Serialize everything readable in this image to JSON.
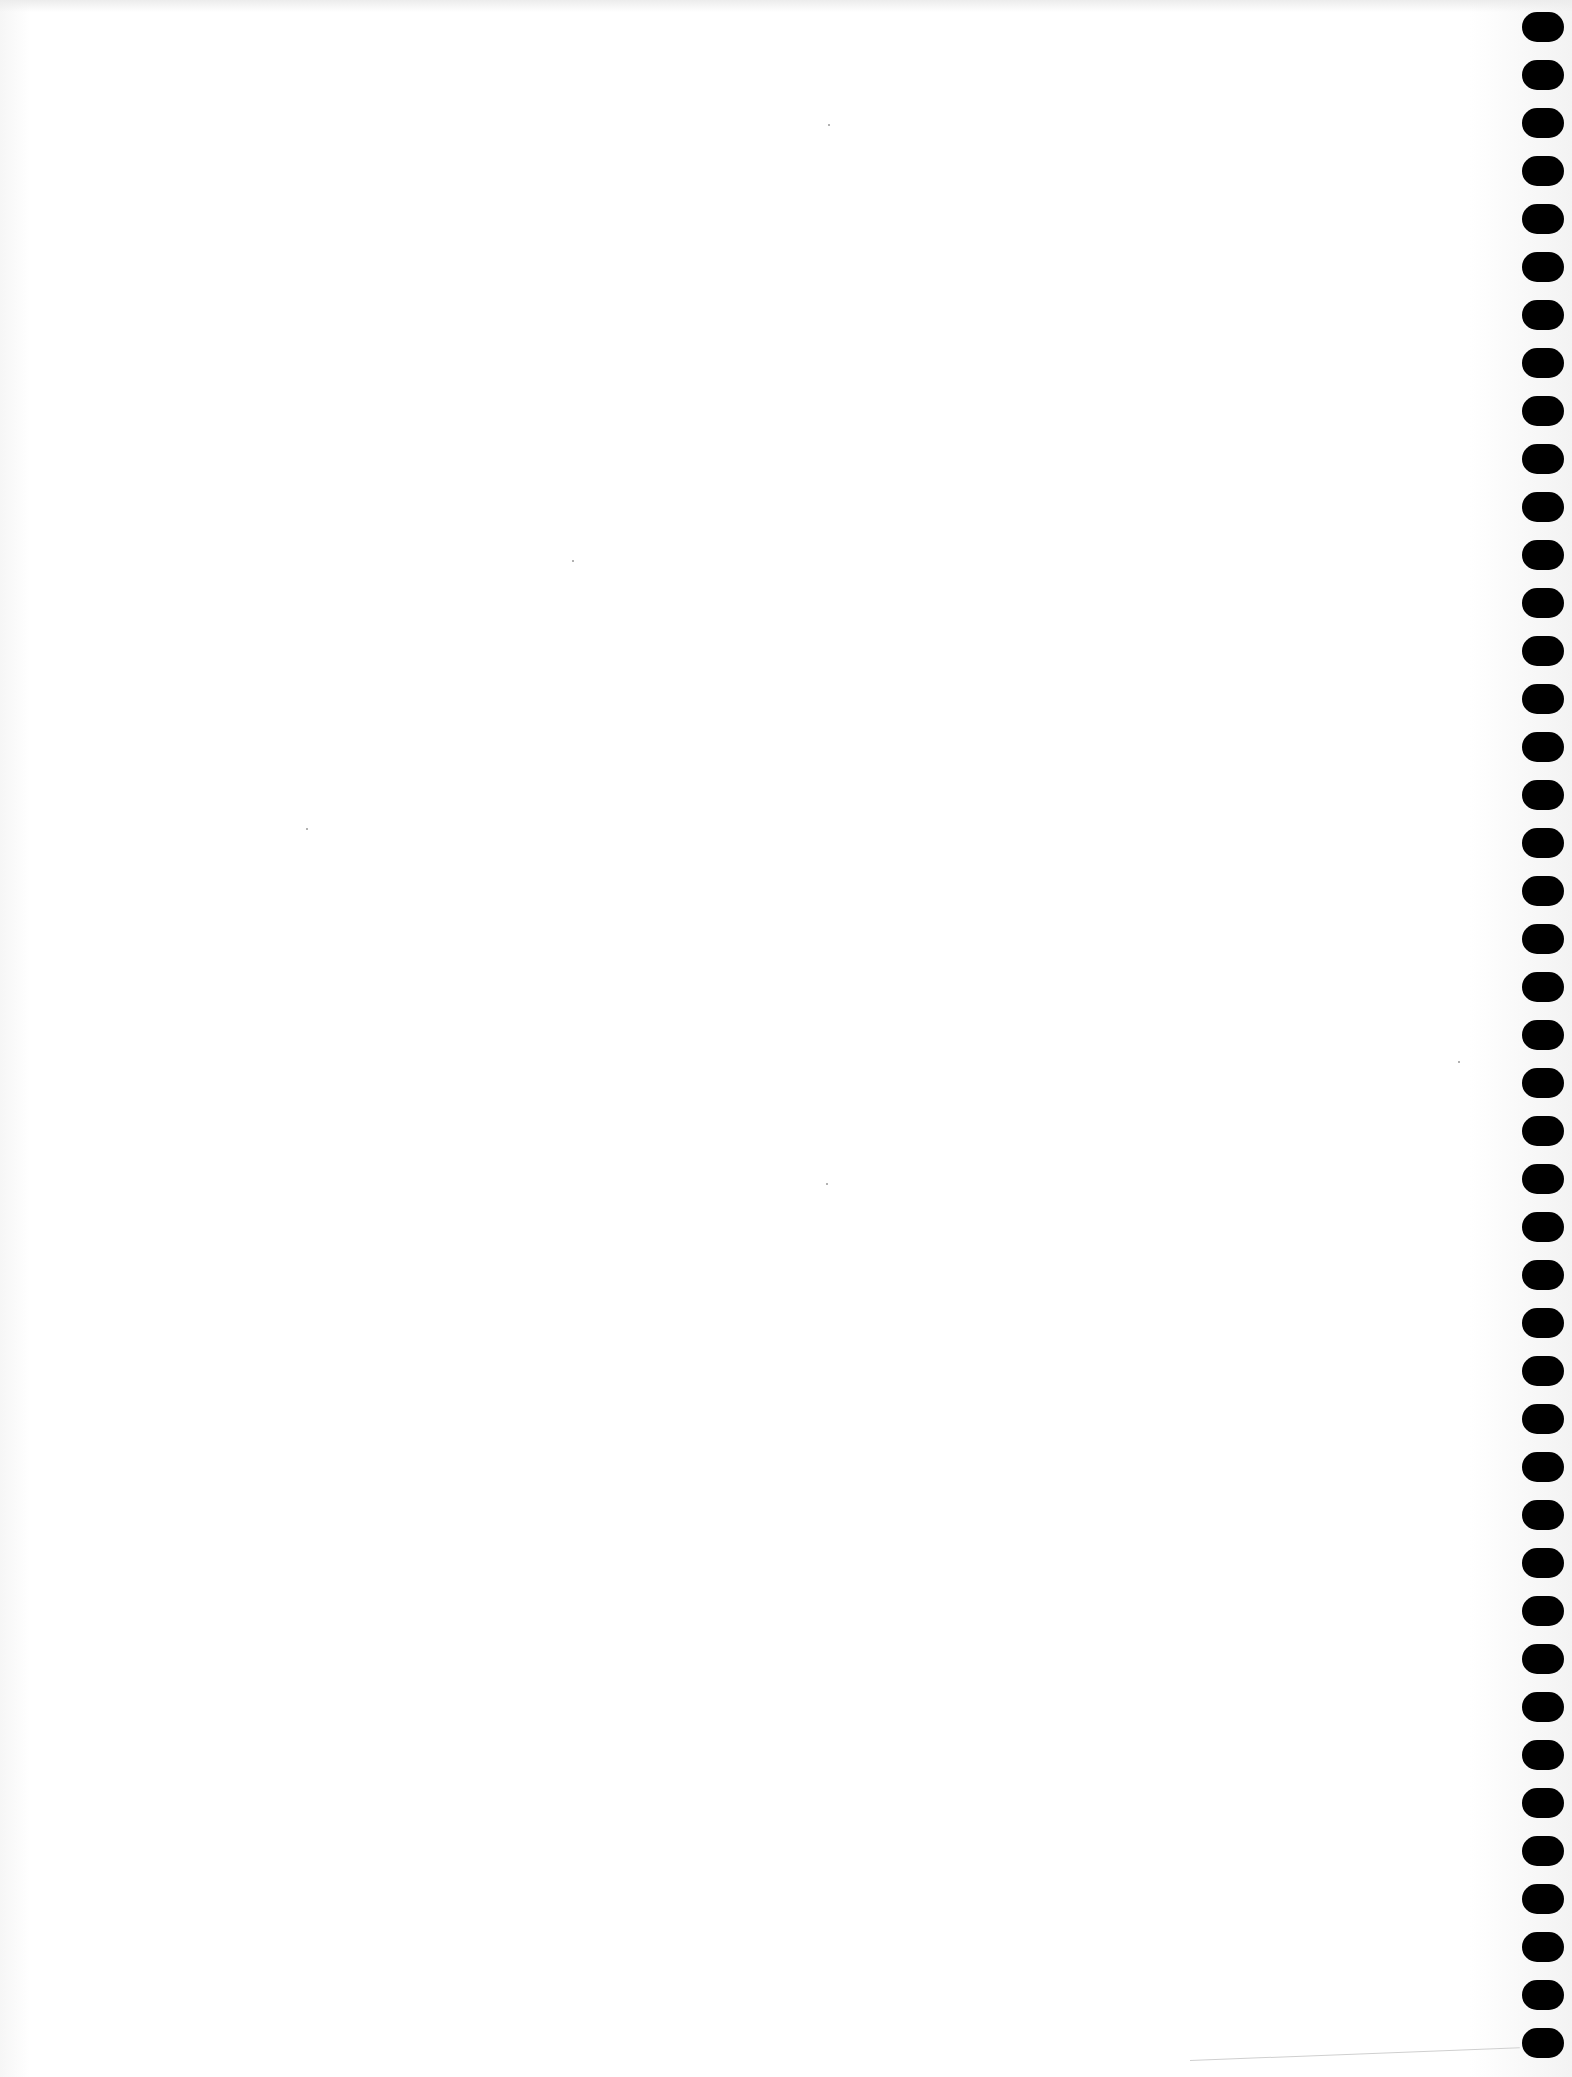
{
  "page": {
    "type": "blank spiral notebook page",
    "content_text": "",
    "background_color": "#ffffff",
    "binding_side": "right",
    "hole_color": "#000000",
    "hole_count": 43,
    "hole_pitch_px": 48,
    "first_hole_center_y": 27
  }
}
